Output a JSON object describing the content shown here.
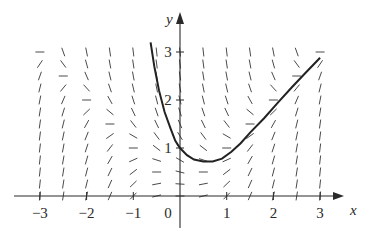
{
  "figure": {
    "x_axis_label": "x",
    "y_axis_label": "y",
    "x_tick_labels": [
      "−3",
      "−2",
      "−1",
      "0",
      "1",
      "2",
      "3"
    ],
    "y_tick_labels": [
      "1",
      "2",
      "3"
    ],
    "colors": {
      "ink": "#2a2a2a",
      "segments": "#4a4a4a",
      "background": "#ffffff"
    }
  },
  "chart_data": {
    "type": "slope_field",
    "title": "",
    "xlabel": "x",
    "ylabel": "y",
    "xlim": [
      -3,
      3
    ],
    "ylim": [
      0,
      3
    ],
    "x_ticks": [
      -3,
      -2,
      -1,
      0,
      1,
      2,
      3
    ],
    "y_ticks": [
      1,
      2,
      3
    ],
    "differential_equation": "dy/dx = x^2 - y^2",
    "grid": {
      "x_start": -3,
      "x_end": 3,
      "x_step": 0.5,
      "y_start": 0,
      "y_end": 3,
      "y_step": 0.25
    },
    "solution_curve": {
      "through_point": [
        0,
        1
      ],
      "points": [
        [
          -0.63,
          3.2
        ],
        [
          -0.55,
          2.7
        ],
        [
          -0.45,
          2.2
        ],
        [
          -0.33,
          1.75
        ],
        [
          -0.2,
          1.4
        ],
        [
          -0.1,
          1.15
        ],
        [
          0,
          1.0
        ],
        [
          0.15,
          0.85
        ],
        [
          0.3,
          0.76
        ],
        [
          0.5,
          0.72
        ],
        [
          0.7,
          0.72
        ],
        [
          0.9,
          0.78
        ],
        [
          1.1,
          0.92
        ],
        [
          1.3,
          1.1
        ],
        [
          1.5,
          1.32
        ],
        [
          1.8,
          1.62
        ],
        [
          2.1,
          1.95
        ],
        [
          2.4,
          2.27
        ],
        [
          2.7,
          2.58
        ],
        [
          3.0,
          2.88
        ]
      ]
    }
  }
}
